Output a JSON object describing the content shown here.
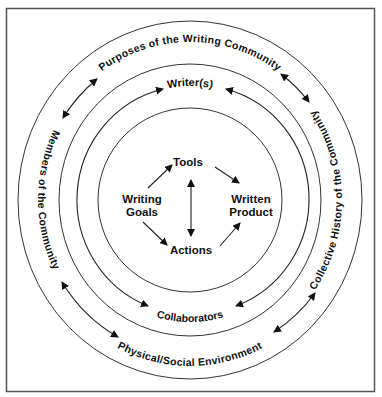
{
  "diagram": {
    "rings": {
      "outer": {
        "top": "Purposes of the Writing Community",
        "left": "Members of the Community",
        "right": "Collective History of the Community",
        "bottom": "Physical/Social Environment"
      },
      "middle": {
        "top": "Writer(s)",
        "bottom": "Collaborators"
      },
      "center": {
        "tools": "Tools",
        "goals_line1": "Writing",
        "goals_line2": "Goals",
        "product_line1": "Written",
        "product_line2": "Product",
        "actions": "Actions"
      }
    },
    "relations": [
      {
        "from": "Purposes of the Writing Community",
        "to": "Members of the Community",
        "type": "bidirectional"
      },
      {
        "from": "Members of the Community",
        "to": "Physical/Social Environment",
        "type": "bidirectional"
      },
      {
        "from": "Purposes of the Writing Community",
        "to": "Collective History of the Community",
        "type": "bidirectional"
      },
      {
        "from": "Collective History of the Community",
        "to": "Physical/Social Environment",
        "type": "bidirectional"
      },
      {
        "from": "Writer(s)",
        "to": "Collaborators",
        "type": "bidirectional",
        "side": "left"
      },
      {
        "from": "Writer(s)",
        "to": "Collaborators",
        "type": "bidirectional",
        "side": "right"
      },
      {
        "from": "Writing Goals",
        "to": "Tools",
        "type": "directed"
      },
      {
        "from": "Writing Goals",
        "to": "Actions",
        "type": "directed"
      },
      {
        "from": "Tools",
        "to": "Actions",
        "type": "bidirectional"
      },
      {
        "from": "Tools",
        "to": "Written Product",
        "type": "directed"
      },
      {
        "from": "Actions",
        "to": "Written Product",
        "type": "directed"
      }
    ],
    "colors": {
      "stroke": "#333333",
      "text": "#111111",
      "frame": "#555555",
      "background": "#ffffff"
    }
  }
}
